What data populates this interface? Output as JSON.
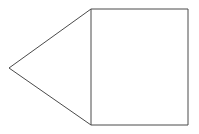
{
  "figure": {
    "canvas": {
      "width": 199,
      "height": 134,
      "background_color": "#ffffff"
    },
    "style": {
      "stroke_color": "#4a4a4a",
      "stroke_width": 1,
      "fill": "none"
    },
    "shapes": [
      {
        "name": "rectangle",
        "type": "rect",
        "x": 91,
        "y": 9,
        "width": 97,
        "height": 116,
        "points": "91,9 188,9 188,125 91,125"
      },
      {
        "name": "triangle",
        "type": "polygon",
        "apex": {
          "x": 9,
          "y": 68
        },
        "points": "91,9 9,68 91,125"
      }
    ],
    "vertices": [
      {
        "label": "apex-left",
        "x": 9,
        "y": 68
      },
      {
        "label": "top-left",
        "x": 91,
        "y": 9
      },
      {
        "label": "top-right",
        "x": 188,
        "y": 9
      },
      {
        "label": "bottom-right",
        "x": 188,
        "y": 125
      },
      {
        "label": "bottom-left",
        "x": 91,
        "y": 125
      }
    ],
    "outline_path": "M 9 68 L 91 9 L 188 9 L 188 125 L 91 125 Z",
    "divider_path": "M 91 9 L 91 125"
  }
}
